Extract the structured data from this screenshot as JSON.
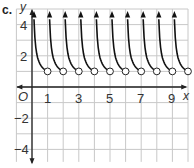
{
  "part_label": "c.",
  "chart_data": {
    "type": "line",
    "title": "",
    "xlabel": "x",
    "ylabel": "y",
    "xlim": [
      -1,
      10
    ],
    "ylim": [
      -5,
      5
    ],
    "grid": true,
    "origin_label": "O",
    "x_tick_labels": [
      "1",
      "3",
      "5",
      "7",
      "9"
    ],
    "x_tick_values": [
      1,
      3,
      5,
      7,
      9
    ],
    "y_tick_labels": [
      "4",
      "2",
      "-2",
      "-4"
    ],
    "y_tick_values": [
      4,
      2,
      -2,
      -4
    ],
    "series": [
      {
        "name": "piecewise branches",
        "open_circles": [
          [
            1,
            1
          ],
          [
            2,
            1
          ],
          [
            3,
            1
          ],
          [
            4,
            1
          ],
          [
            5,
            1
          ],
          [
            6,
            1
          ],
          [
            7,
            1
          ],
          [
            8,
            1
          ],
          [
            9,
            1
          ],
          [
            10,
            1
          ]
        ],
        "branch_intervals": [
          [
            0,
            1
          ],
          [
            1,
            2
          ],
          [
            2,
            3
          ],
          [
            3,
            4
          ],
          [
            4,
            5
          ],
          [
            5,
            6
          ],
          [
            6,
            7
          ],
          [
            7,
            8
          ],
          [
            8,
            9
          ],
          [
            9,
            10
          ]
        ],
        "arrow_up_near_x": [
          0.15,
          1.15,
          2.15,
          3.15,
          4.15,
          5.15,
          6.15,
          7.15,
          8.15,
          9.15
        ]
      }
    ],
    "colors": {
      "grid": "#c8c8c8",
      "axis": "#222222",
      "curve": "#111111",
      "circle_fill": "#ffffff"
    }
  }
}
